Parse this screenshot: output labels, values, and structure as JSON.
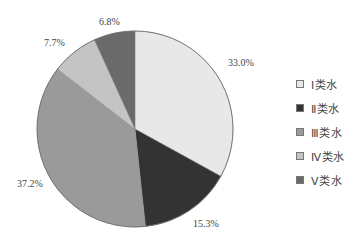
{
  "chart_data": {
    "type": "pie",
    "title": "",
    "categories": [
      "Ⅰ类水",
      "Ⅱ类水",
      "Ⅲ类水",
      "Ⅳ类水",
      "Ⅴ类水"
    ],
    "values": [
      33.0,
      15.3,
      37.2,
      7.7,
      6.8
    ],
    "labels": [
      "33.0%",
      "15.3%",
      "37.2%",
      "7.7%",
      "6.8%"
    ],
    "colors": [
      "#e8e8e8",
      "#333333",
      "#9a9a9a",
      "#c4c4c4",
      "#6a6a6a"
    ],
    "start_angle_deg": 0,
    "direction": "clockwise",
    "legend_position": "right",
    "unit": "%"
  },
  "legend": {
    "items": [
      {
        "label": "Ⅰ类水",
        "color": "#e8e8e8"
      },
      {
        "label": "Ⅱ类水",
        "color": "#333333"
      },
      {
        "label": "Ⅲ类水",
        "color": "#9a9a9a"
      },
      {
        "label": "Ⅳ类水",
        "color": "#c4c4c4"
      },
      {
        "label": "Ⅴ类水",
        "color": "#6a6a6a"
      }
    ]
  }
}
